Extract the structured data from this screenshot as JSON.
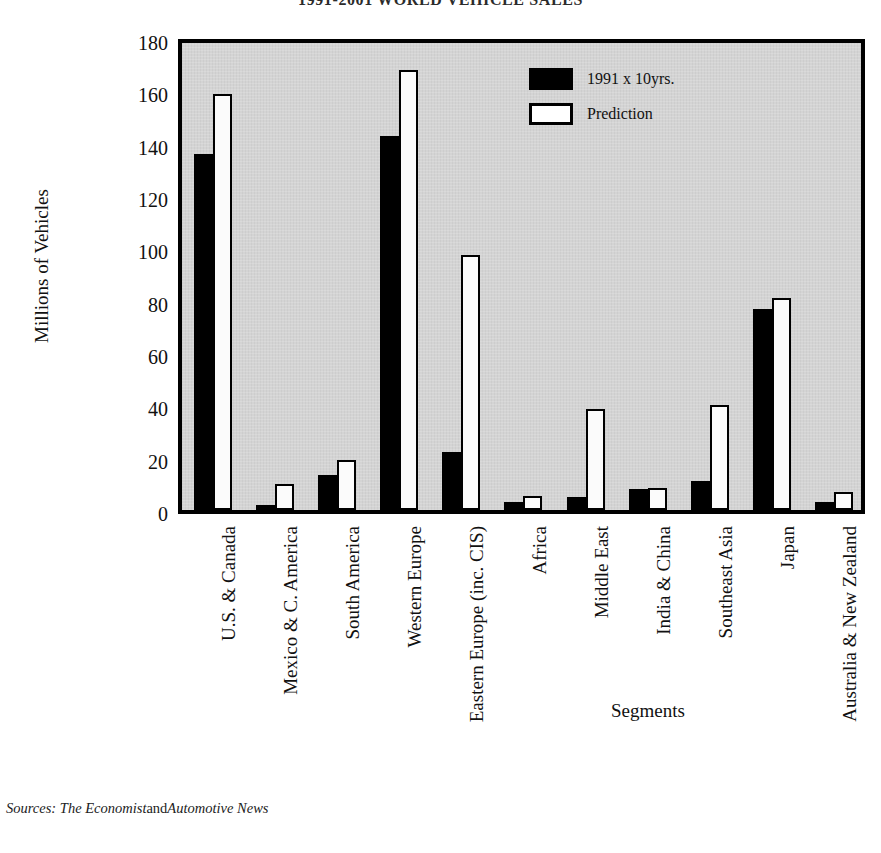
{
  "title": "1991-2001 WORLD VEHICLE SALES",
  "axis": {
    "y_title": "Millions of Vehicles",
    "x_title": "Segments",
    "y_ticks": [
      "0",
      "20",
      "40",
      "60",
      "80",
      "100",
      "120",
      "140",
      "160",
      "180"
    ]
  },
  "legend": {
    "items": [
      {
        "label": "1991 x 10yrs.",
        "swatch": "black",
        "color": "#000000"
      },
      {
        "label": "Prediction",
        "swatch": "white",
        "color": "#ffffff"
      }
    ]
  },
  "source": {
    "prefix": "Sources:",
    "pub1": "The Economist",
    "conjunction": "and",
    "pub2": "Automotive News"
  },
  "chart_data": {
    "type": "bar",
    "title": "1991-2001 WORLD VEHICLE SALES",
    "xlabel": "Segments",
    "ylabel": "Millions of Vehicles",
    "ylim": [
      0,
      180
    ],
    "ytick_step": 20,
    "grid": false,
    "legend_position": "top-right",
    "categories": [
      "U.S. & Canada",
      "Mexico & C. America",
      "South America",
      "Western Europe",
      "Eastern Europe (inc. CIS)",
      "Africa",
      "Middle East",
      "India & China",
      "Southeast Asia",
      "Japan",
      "Australia & New Zealand"
    ],
    "series": [
      {
        "name": "1991 x 10yrs.",
        "color": "#000000",
        "values": [
          136,
          2,
          13.5,
          143,
          22,
          3,
          5,
          8,
          11,
          77,
          3
        ]
      },
      {
        "name": "Prediction",
        "color": "#ffffff",
        "values": [
          159,
          10,
          19,
          168,
          97.5,
          5.5,
          38.5,
          8.5,
          40,
          81,
          7
        ]
      }
    ]
  }
}
